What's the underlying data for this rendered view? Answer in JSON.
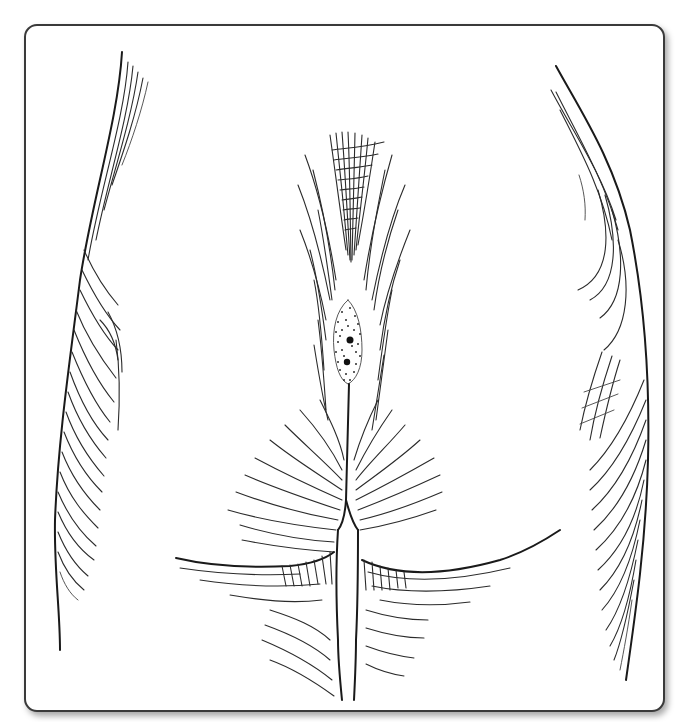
{
  "figure": {
    "subject": "Line illustration of sacrococcygeal region viewed from behind, showing midline pilonidal sinus pits",
    "frame": {
      "border_color": "#3a3a3a",
      "background": "#ffffff",
      "corner_radius_px": 13,
      "has_drop_shadow": true
    },
    "ink_color": "#2b2b2b",
    "features": [
      {
        "name": "left-flank-contour",
        "description": "hatched outline of left hip/flank"
      },
      {
        "name": "right-flank-contour",
        "description": "hatched outline of right hip/flank"
      },
      {
        "name": "sacral-hair-tuft",
        "description": "cross-hatched converging hair over sacrum"
      },
      {
        "name": "pilonidal-sinus-area",
        "description": "stippled oval in natal cleft with two dark sinus pits"
      },
      {
        "name": "natal-cleft",
        "description": "midline intergluteal fold"
      },
      {
        "name": "gluteal-folds",
        "description": "left and right lower buttock creases with cross-hatching"
      }
    ],
    "sinus_pits": [
      {
        "x": 350,
        "y": 340
      },
      {
        "x": 347,
        "y": 362
      }
    ]
  }
}
